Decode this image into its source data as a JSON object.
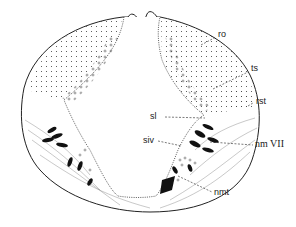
{
  "figure": {
    "type": "anatomical cross-section line drawing",
    "labels": {
      "ro": "ro",
      "ts": "ts",
      "rst": "rst",
      "sl": "sl",
      "siv": "siv",
      "nm_vii": "nm VII",
      "nmt": "nmt"
    },
    "colors": {
      "ink": "#222222",
      "background": "#ffffff"
    }
  }
}
